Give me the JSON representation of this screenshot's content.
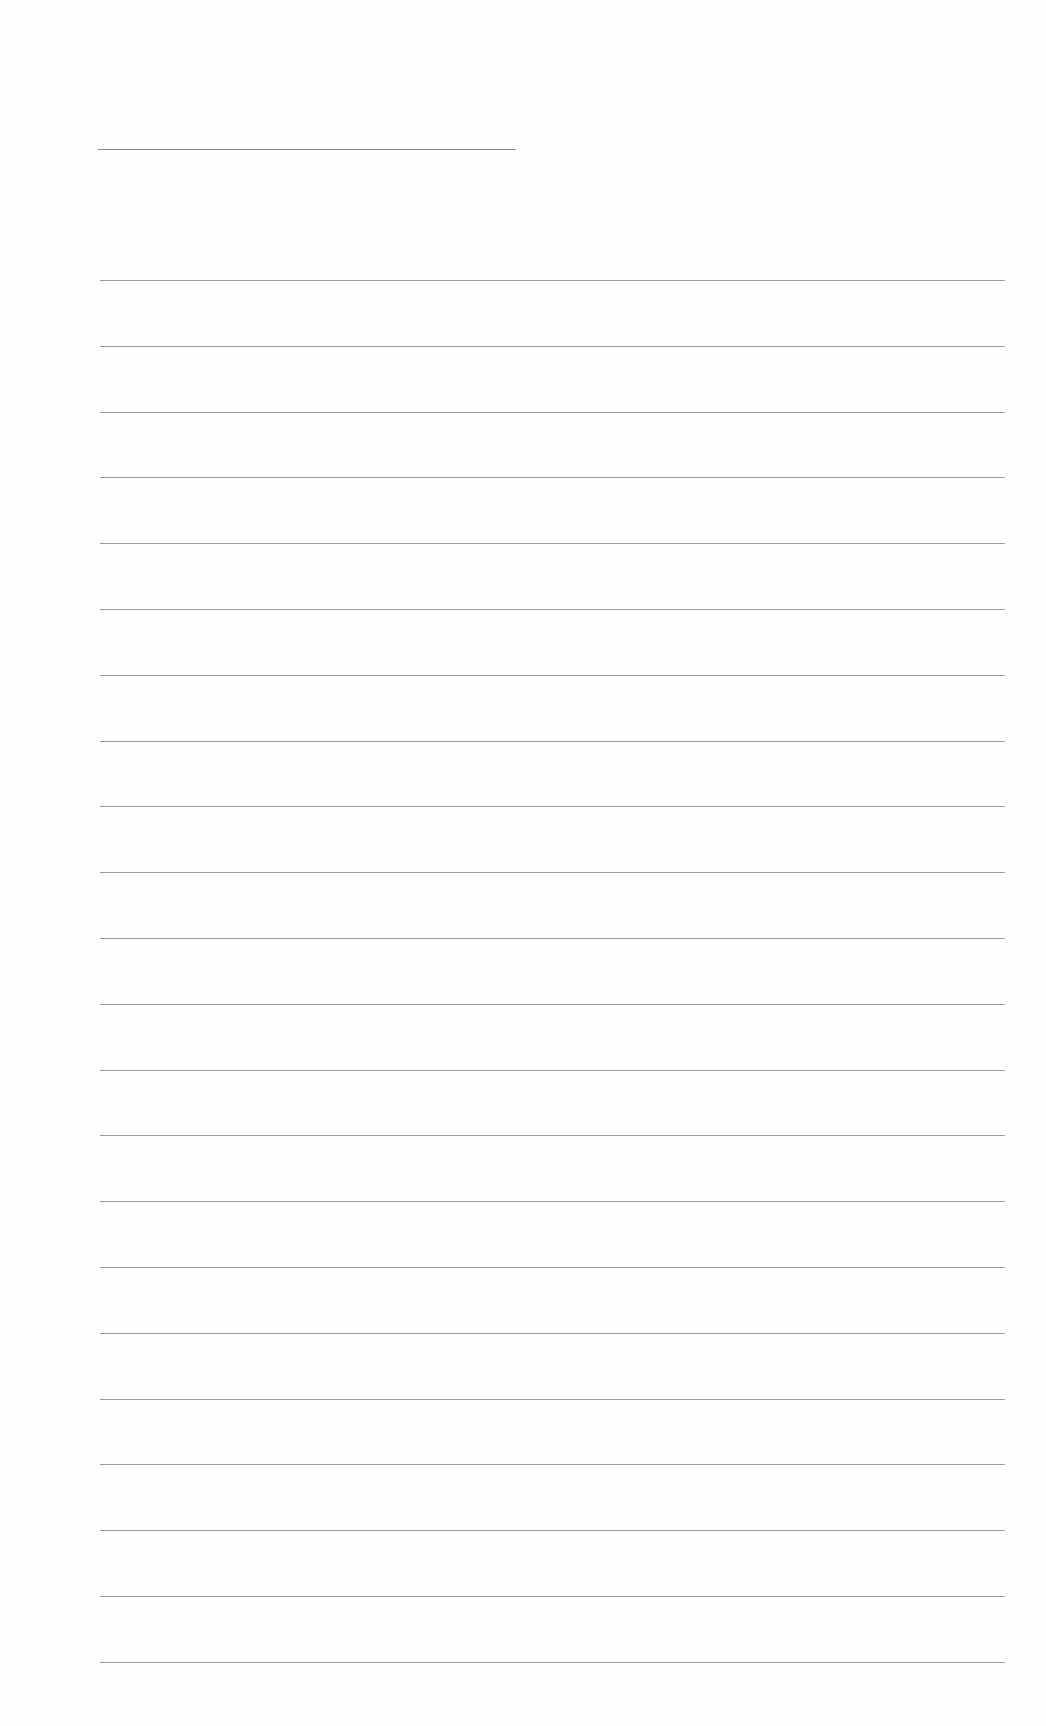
{
  "document": {
    "type": "lined-paper",
    "background_color": "#fefefe",
    "line_color": "#9a9a9a",
    "header_line": {
      "x_start": 98,
      "x_end": 516,
      "y": 149
    },
    "ruled_lines": {
      "count": 22,
      "x_start": 100,
      "x_end": 1005,
      "first_y": 280,
      "spacing": 65.8
    },
    "text": []
  }
}
